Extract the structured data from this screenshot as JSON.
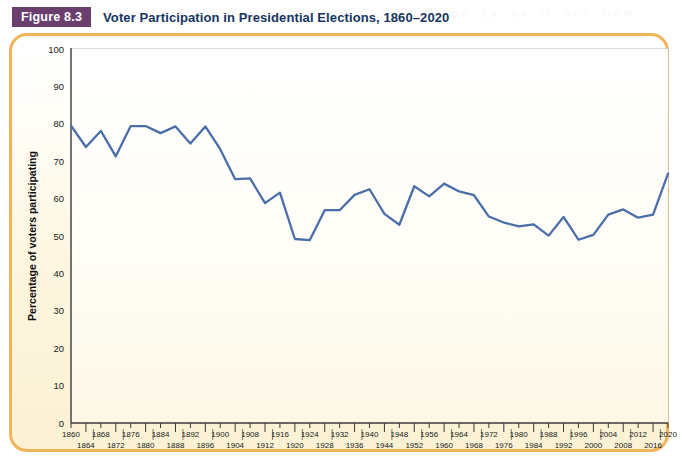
{
  "figure": {
    "badge_label": "Figure 8.3",
    "title": "Voter Participation in Presidential Elections, 1860–2020"
  },
  "colors": {
    "badge_bg": "#6a3f6e",
    "badge_text": "#ffffff",
    "title_text": "#16355f",
    "panel_border": "#f0b45a",
    "panel_bg_top": "#ffffff",
    "panel_bg_bottom": "#fbf1d4",
    "line": "#4a6fa8",
    "gridline": "#c9c9c9",
    "axis": "#3a3a3a"
  },
  "chart_data": {
    "type": "line",
    "title": "Voter Participation in Presidential Elections, 1860–2020",
    "xlabel": "",
    "ylabel": "Percentage of voters participating",
    "ylim": [
      0,
      100
    ],
    "ytick_step": 10,
    "yticks": [
      0,
      10,
      20,
      30,
      40,
      50,
      60,
      70,
      80,
      90,
      100
    ],
    "grid": true,
    "legend": "none",
    "xlim": [
      1860,
      2020
    ],
    "xtick_step": 4,
    "x_label_rows": "alternating",
    "categories": [
      "1860",
      "1864",
      "1868",
      "1872",
      "1876",
      "1880",
      "1884",
      "1888",
      "1892",
      "1896",
      "1900",
      "1904",
      "1908",
      "1912",
      "1916",
      "1920",
      "1924",
      "1928",
      "1932",
      "1936",
      "1940",
      "1944",
      "1948",
      "1952",
      "1956",
      "1960",
      "1964",
      "1968",
      "1972",
      "1976",
      "1980",
      "1984",
      "1988",
      "1992",
      "1996",
      "2000",
      "2004",
      "2008",
      "2012",
      "2016",
      "2020"
    ],
    "values": [
      79.5,
      73.8,
      78.1,
      71.3,
      79.4,
      79.4,
      77.5,
      79.3,
      74.7,
      79.3,
      73.2,
      65.2,
      65.4,
      58.8,
      61.6,
      49.2,
      48.9,
      56.9,
      56.9,
      61.0,
      62.5,
      55.9,
      53.0,
      63.3,
      60.6,
      64.0,
      61.9,
      60.9,
      55.2,
      53.6,
      52.6,
      53.1,
      50.1,
      55.1,
      49.0,
      50.3,
      55.7,
      57.1,
      54.9,
      55.7,
      66.7
    ]
  },
  "bleed_text": "the of the when  in which  for  on  not  that  a  to  with  be  by  as  it  are  from"
}
